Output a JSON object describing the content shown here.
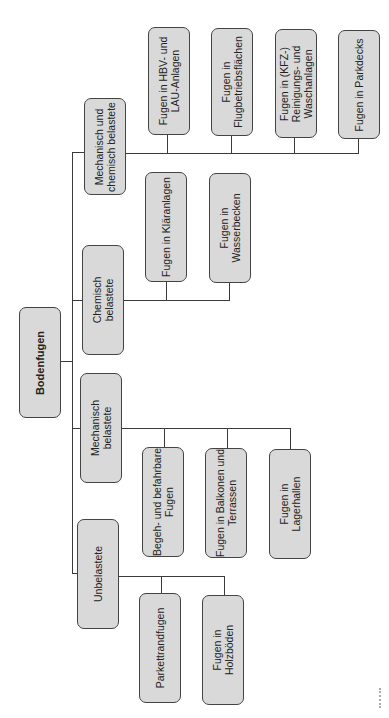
{
  "diagram": {
    "type": "tree",
    "orientation": "rotated-90-ccw",
    "root": {
      "label": "Bodenfugen"
    },
    "categories": [
      {
        "label": "Mechanisch und\nchemisch belastete",
        "children": [
          {
            "label": "Fugen in HBV- und\nLAU-Anlagen"
          },
          {
            "label": "Fugen in\nFlugbetriebsflächen"
          },
          {
            "label": "Fugen in (KFZ-)\nReinigungs- und\nWaschanlagen"
          },
          {
            "label": "Fugen in Parkdecks"
          }
        ]
      },
      {
        "label": "Chemisch\nbelastete",
        "children": [
          {
            "label": "Fugen in Kläranlagen"
          },
          {
            "label": "Fugen in\nWasserbecken"
          }
        ]
      },
      {
        "label": "Mechanisch\nbelastete",
        "children": [
          {
            "label": "Begeh- und befahrbare\nFugen"
          },
          {
            "label": "Fugen in Balkonen und\nTerrassen"
          },
          {
            "label": "Fugen in\nLagerhallen"
          }
        ]
      },
      {
        "label": "Unbelastete",
        "children": [
          {
            "label": "Parkettrandfugen"
          },
          {
            "label": "Fugen in\nHolzböden"
          }
        ]
      }
    ],
    "colors": {
      "box_fill": "#d9d9d9",
      "box_border": "#444444",
      "line": "#3a3a3a",
      "background": "#ffffff"
    }
  }
}
